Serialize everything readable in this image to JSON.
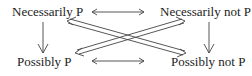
{
  "diagram": {
    "nodes": {
      "top_left": "Necessarily P",
      "top_right": "Necessarily not P",
      "bottom_left": "Possibly P",
      "bottom_right": "Possibly not P"
    },
    "edges": [
      {
        "from": "top_left",
        "to": "top_right",
        "style": "double-headed"
      },
      {
        "from": "bottom_left",
        "to": "bottom_right",
        "style": "double-headed"
      },
      {
        "from": "top_left",
        "to": "bottom_left",
        "style": "single-headed"
      },
      {
        "from": "top_right",
        "to": "bottom_right",
        "style": "single-headed"
      },
      {
        "from": "top_left",
        "to": "bottom_right",
        "style": "double-headed-hollow"
      },
      {
        "from": "top_right",
        "to": "bottom_left",
        "style": "double-headed-hollow"
      }
    ],
    "colors": {
      "line": "#444444",
      "text": "#222222"
    }
  }
}
